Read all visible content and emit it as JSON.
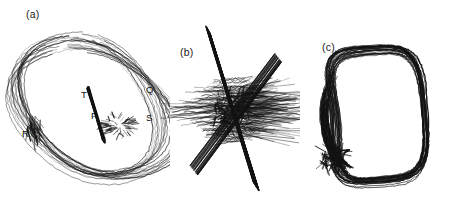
{
  "figure": {
    "background_color": "#ffffff",
    "ink_color": "#131313",
    "width": 450,
    "height": 212,
    "panel_count": 3
  },
  "panels": [
    {
      "id": "a",
      "caption": "(a)",
      "description": "Large open scribbled loop with reversal labels",
      "labels": [
        {
          "id": "T",
          "text": "T",
          "x": 81,
          "y": 90
        },
        {
          "id": "Q",
          "text": "Q",
          "x": 146,
          "y": 85
        },
        {
          "id": "P",
          "text": "P",
          "x": 91,
          "y": 111
        },
        {
          "id": "S",
          "text": "S",
          "x": 146,
          "y": 113
        },
        {
          "id": "R",
          "text": "R",
          "x": 22,
          "y": 129
        }
      ]
    },
    {
      "id": "b",
      "caption": "(b)",
      "description": "Collapsed crossed scribble, degenerate loop",
      "labels": []
    },
    {
      "id": "c",
      "caption": "(c)",
      "description": "Dense closed rounded-rectangular loop",
      "labels": []
    }
  ],
  "chart_data": {
    "type": "line",
    "title": "",
    "subtitle": "",
    "xlabel": "",
    "ylabel": "",
    "grid": false,
    "legend_position": "none",
    "series": [
      {
        "name": "panel-a-trace",
        "panel": "a",
        "shape": "open-scribbled-loop",
        "n_repeats": 22,
        "center": [
          92,
          108
        ],
        "radius_x": 68,
        "radius_y": 78,
        "annotations": [
          "T",
          "Q",
          "P",
          "S",
          "R"
        ]
      },
      {
        "name": "panel-b-trace",
        "panel": "b",
        "shape": "collapsed-crossed-scribble",
        "n_repeats": 60,
        "center": [
          72,
          110
        ],
        "radius_x": 60,
        "radius_y": 70,
        "annotations": []
      },
      {
        "name": "panel-c-trace",
        "panel": "c",
        "shape": "closed-rounded-rect-loop",
        "n_repeats": 26,
        "center": [
          75,
          115
        ],
        "radius_x": 50,
        "radius_y": 66,
        "annotations": []
      }
    ]
  }
}
